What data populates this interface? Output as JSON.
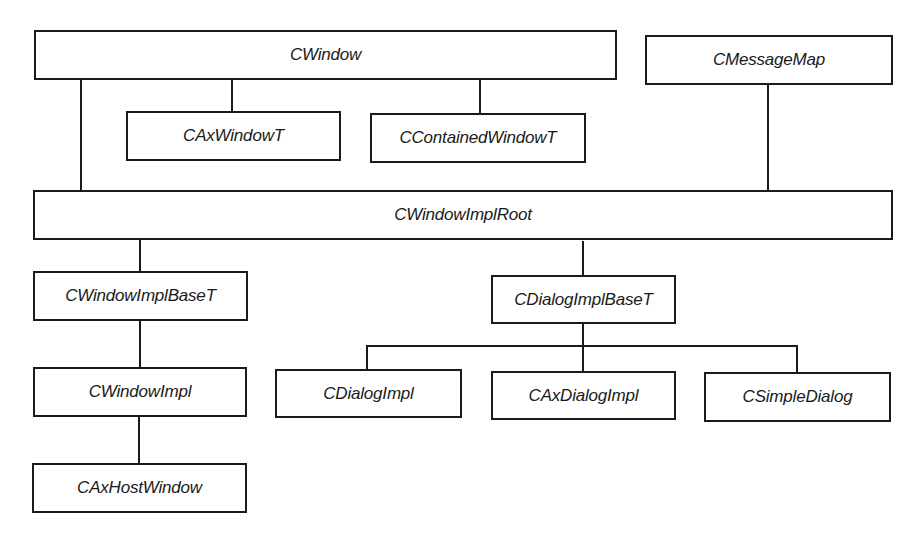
{
  "diagram": {
    "nodes": {
      "cwindow": {
        "label": "CWindow"
      },
      "caxwindowt": {
        "label": "CAxWindowT"
      },
      "ccontainedwindowt": {
        "label": "CContainedWindowT"
      },
      "cmessagemap": {
        "label": "CMessageMap"
      },
      "cwindowimplroot": {
        "label": "CWindowImplRoot"
      },
      "cwindowimplbaset": {
        "label": "CWindowImplBaseT"
      },
      "cdialogimplbaset": {
        "label": "CDialogImplBaseT"
      },
      "cwindowimpl": {
        "label": "CWindowImpl"
      },
      "cdialogimpl": {
        "label": "CDialogImpl"
      },
      "caxdialogimpl": {
        "label": "CAxDialogImpl"
      },
      "csimpledialog": {
        "label": "CSimpleDialog"
      },
      "caxhostwindow": {
        "label": "CAxHostWindow"
      }
    },
    "edges": [
      {
        "from": "cwindow",
        "to": "caxwindowt"
      },
      {
        "from": "cwindow",
        "to": "ccontainedwindowt"
      },
      {
        "from": "cwindow",
        "to": "cwindowimplroot"
      },
      {
        "from": "cmessagemap",
        "to": "cwindowimplroot"
      },
      {
        "from": "cwindowimplroot",
        "to": "cwindowimplbaset"
      },
      {
        "from": "cwindowimplroot",
        "to": "cdialogimplbaset"
      },
      {
        "from": "cwindowimplbaset",
        "to": "cwindowimpl"
      },
      {
        "from": "cwindowimpl",
        "to": "caxhostwindow"
      },
      {
        "from": "cdialogimplbaset",
        "to": "cdialogimpl"
      },
      {
        "from": "cdialogimplbaset",
        "to": "caxdialogimpl"
      },
      {
        "from": "cdialogimplbaset",
        "to": "csimpledialog"
      }
    ],
    "colors": {
      "stroke": "#1a1a1a",
      "fill": "#ffffff",
      "text": "#1a1a1a"
    }
  }
}
